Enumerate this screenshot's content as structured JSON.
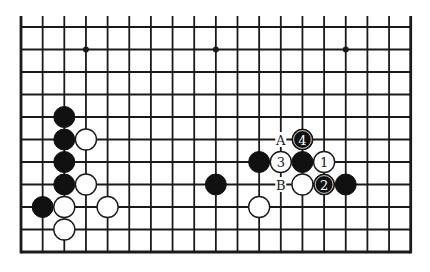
{
  "diagram": {
    "type": "go-board-fragment",
    "board_size": 19,
    "visible_columns": 19,
    "visible_rows": 11,
    "edges": [
      "left",
      "right",
      "bottom"
    ],
    "star_points": [
      {
        "col": 3,
        "row": 1
      },
      {
        "col": 9,
        "row": 1
      },
      {
        "col": 15,
        "row": 1
      }
    ],
    "stones": [
      {
        "color": "black",
        "col": 2,
        "row": 4,
        "label": ""
      },
      {
        "color": "black",
        "col": 2,
        "row": 5,
        "label": ""
      },
      {
        "color": "white",
        "col": 3,
        "row": 5,
        "label": ""
      },
      {
        "color": "black",
        "col": 2,
        "row": 6,
        "label": ""
      },
      {
        "color": "black",
        "col": 2,
        "row": 7,
        "label": ""
      },
      {
        "color": "white",
        "col": 3,
        "row": 7,
        "label": ""
      },
      {
        "color": "black",
        "col": 1,
        "row": 8,
        "label": ""
      },
      {
        "color": "white",
        "col": 2,
        "row": 8,
        "label": ""
      },
      {
        "color": "white",
        "col": 4,
        "row": 8,
        "label": ""
      },
      {
        "color": "white",
        "col": 2,
        "row": 9,
        "label": ""
      },
      {
        "color": "black",
        "col": 9,
        "row": 7,
        "label": ""
      },
      {
        "color": "black",
        "col": 11,
        "row": 6,
        "label": ""
      },
      {
        "color": "white",
        "col": 11,
        "row": 8,
        "label": ""
      },
      {
        "color": "black",
        "col": 13,
        "row": 5,
        "label": "4"
      },
      {
        "color": "white",
        "col": 12,
        "row": 6,
        "label": "3"
      },
      {
        "color": "black",
        "col": 13,
        "row": 6,
        "label": ""
      },
      {
        "color": "white",
        "col": 14,
        "row": 6,
        "label": "1"
      },
      {
        "color": "white",
        "col": 13,
        "row": 7,
        "label": ""
      },
      {
        "color": "black",
        "col": 14,
        "row": 7,
        "label": "2"
      },
      {
        "color": "black",
        "col": 15,
        "row": 7,
        "label": ""
      }
    ],
    "markers": [
      {
        "text": "A",
        "col": 12,
        "row": 5
      },
      {
        "text": "B",
        "col": 12,
        "row": 7
      }
    ],
    "colors": {
      "black": "#111111",
      "white": "#ffffff",
      "line": "#1a1a1a"
    }
  }
}
